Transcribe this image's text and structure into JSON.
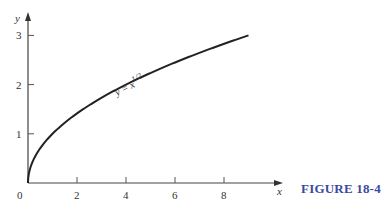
{
  "figure": {
    "caption": "FIGURE 18-4",
    "caption_color": "#3b4aa0"
  },
  "chart_data": {
    "type": "line",
    "title": "",
    "xlabel": "x",
    "ylabel": "y",
    "xlim": [
      0,
      10.5
    ],
    "ylim": [
      0,
      3.2
    ],
    "grid": false,
    "legend": null,
    "x_ticks": [
      0,
      2,
      4,
      6,
      8
    ],
    "x_tick_labels": [
      "0",
      "2",
      "4",
      "6",
      "8"
    ],
    "y_ticks": [
      1,
      2,
      3
    ],
    "y_tick_labels": [
      "1",
      "2",
      "3"
    ],
    "series": [
      {
        "name": "y = x^1/2",
        "label": "y = x",
        "label_exponent": "1/2",
        "x": [
          0,
          0.05,
          0.1,
          0.25,
          0.5,
          1,
          1.5,
          2,
          3,
          4,
          5,
          6,
          7,
          8,
          9
        ],
        "values": [
          0,
          0.224,
          0.316,
          0.5,
          0.707,
          1,
          1.225,
          1.414,
          1.732,
          2,
          2.236,
          2.449,
          2.646,
          2.828,
          3
        ]
      }
    ],
    "annotations": [
      {
        "text": "y = x^1/2",
        "x": 3.6,
        "y": 2.0,
        "rotation": -27
      }
    ]
  }
}
